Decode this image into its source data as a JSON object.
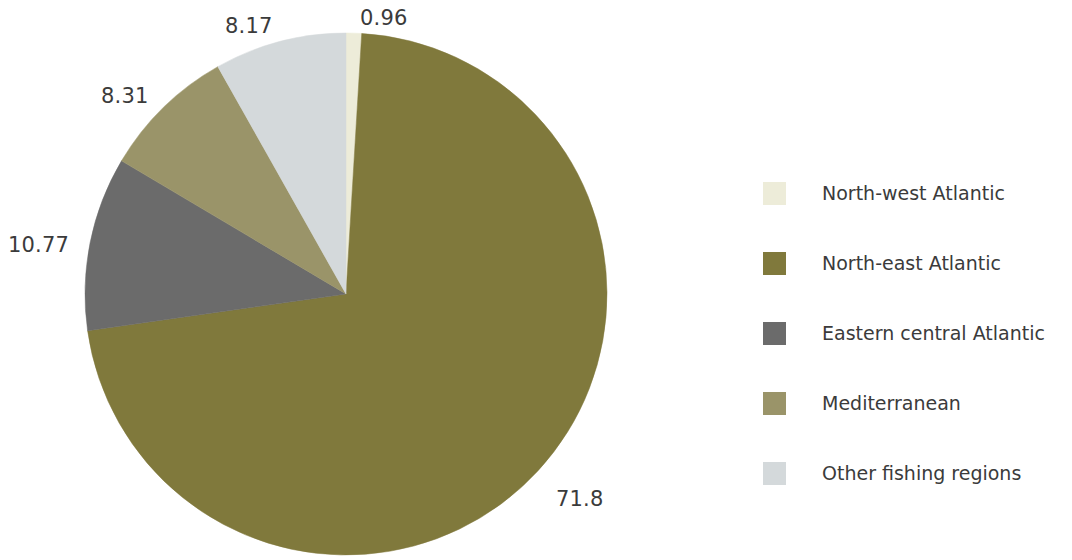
{
  "chart_data": {
    "type": "pie",
    "title": "",
    "subtitle": "",
    "xlabel": "",
    "ylabel": "",
    "grid": false,
    "legend_position": "right",
    "start_angle_deg": 0,
    "direction": "clockwise",
    "categories": [
      "North-west Atlantic",
      "North-east Atlantic",
      "Eastern central Atlantic",
      "Mediterranean",
      "Other fishing regions"
    ],
    "values": [
      0.96,
      71.8,
      10.77,
      8.31,
      8.17
    ],
    "value_labels": [
      "0.96",
      "71.8",
      "10.77",
      "8.31",
      "8.17"
    ],
    "colors": [
      "#edecd9",
      "#80793c",
      "#6b6b6b",
      "#9a9469",
      "#d4d9db"
    ],
    "slices": [
      {
        "label": "North-west Atlantic",
        "value": 0.96,
        "display": "0.96",
        "color": "#edecd9"
      },
      {
        "label": "North-east Atlantic",
        "value": 71.8,
        "display": "71.8",
        "color": "#80793c"
      },
      {
        "label": "Eastern central Atlantic",
        "value": 10.77,
        "display": "10.77",
        "color": "#6b6b6b"
      },
      {
        "label": "Mediterranean",
        "value": 8.31,
        "display": "8.31",
        "color": "#9a9469"
      },
      {
        "label": "Other fishing regions",
        "value": 8.17,
        "display": "8.17",
        "color": "#d4d9db"
      }
    ]
  },
  "pie": {
    "center_x": 346,
    "center_y": 294,
    "radius": 261,
    "labels": {
      "north_west_atlantic": "0.96",
      "north_east_atlantic": "71.8",
      "eastern_central_atlantic": "10.77",
      "mediterranean": "8.31",
      "other_fishing_regions": "8.17"
    }
  },
  "legend": {
    "items": [
      {
        "label": "North-west Atlantic",
        "color": "#edecd9"
      },
      {
        "label": "North-east Atlantic",
        "color": "#80793c"
      },
      {
        "label": "Eastern central Atlantic",
        "color": "#6b6b6b"
      },
      {
        "label": "Mediterranean",
        "color": "#9a9469"
      },
      {
        "label": "Other fishing regions",
        "color": "#d4d9db"
      }
    ]
  },
  "colors": {
    "background": "#ffffff",
    "text": "#3b3b3b"
  }
}
